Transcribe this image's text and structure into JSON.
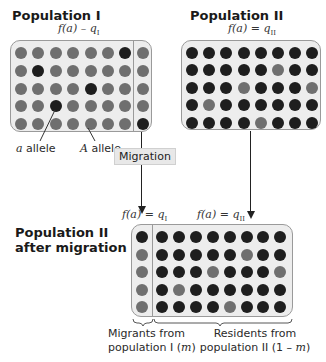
{
  "population_1": {
    "title": "Population I",
    "formula": {
      "lhs": "f(a) – q",
      "sub": "I"
    },
    "grid": [
      [
        "A",
        "A",
        "A",
        "A",
        "A",
        "A",
        "a",
        "A"
      ],
      [
        "A",
        "a",
        "A",
        "A",
        "A",
        "A",
        "A",
        "A"
      ],
      [
        "A",
        "A",
        "A",
        "A",
        "a",
        "A",
        "A",
        "A"
      ],
      [
        "A",
        "A",
        "a",
        "A",
        "A",
        "A",
        "A",
        "A"
      ],
      [
        "A",
        "A",
        "A",
        "A",
        "A",
        "A",
        "A",
        "a"
      ]
    ],
    "divider_after_column": 7
  },
  "population_2": {
    "title": "Population II",
    "formula": {
      "lhs": "f(a) = q",
      "sub": "II"
    },
    "grid": [
      [
        "a",
        "a",
        "a",
        "a",
        "a",
        "a",
        "a",
        "a"
      ],
      [
        "a",
        "a",
        "a",
        "a",
        "a",
        "A",
        "a",
        "a"
      ],
      [
        "a",
        "a",
        "a",
        "A",
        "a",
        "a",
        "a",
        "A"
      ],
      [
        "a",
        "A",
        "a",
        "a",
        "a",
        "a",
        "a",
        "a"
      ],
      [
        "a",
        "a",
        "a",
        "a",
        "A",
        "a",
        "a",
        "a"
      ]
    ]
  },
  "labels": {
    "a_allele": {
      "italic": "a",
      "text": " allele"
    },
    "A_allele": {
      "italic": "A",
      "text": " allele"
    },
    "migration": "Migration"
  },
  "after_migration": {
    "title_line1": "Population II",
    "title_line2": "after migration",
    "formula_migrants": {
      "lhs": "f(a) = q",
      "sub": "I"
    },
    "formula_residents": {
      "lhs": "f(a) = q",
      "sub": "II"
    },
    "migrant_column": [
      "a",
      "A",
      "A",
      "A",
      "A"
    ],
    "resident_grid": [
      [
        "a",
        "a",
        "a",
        "a",
        "a",
        "a",
        "a",
        "a"
      ],
      [
        "a",
        "a",
        "a",
        "a",
        "a",
        "A",
        "a",
        "a"
      ],
      [
        "a",
        "a",
        "a",
        "A",
        "a",
        "a",
        "a",
        "A"
      ],
      [
        "a",
        "A",
        "a",
        "a",
        "a",
        "a",
        "a",
        "a"
      ],
      [
        "a",
        "a",
        "a",
        "a",
        "A",
        "a",
        "a",
        "a"
      ]
    ],
    "caption_migrants": {
      "line1": "Migrants from",
      "line2_text": "population I (",
      "line2_italic": "m",
      "line2_end": ")"
    },
    "caption_residents": {
      "line1": "Residents from",
      "line2_text": "population II (1 – ",
      "line2_italic": "m",
      "line2_end": ")"
    }
  },
  "legend": {
    "a_allele_color": "#1e1e1e",
    "A_allele_color": "#6f6f6f",
    "panel_background": "#ededed",
    "panel_border": "#9a9a9a"
  }
}
